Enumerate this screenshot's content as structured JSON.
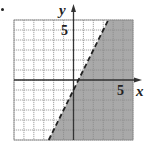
{
  "chart_data": {
    "type": "inequality-graph",
    "title": "",
    "xlabel": "x",
    "ylabel": "y",
    "xlim": [
      -6,
      6
    ],
    "ylim": [
      -6,
      6
    ],
    "grid": true,
    "grid_step": 1,
    "tick_labels": {
      "x": [
        "5"
      ],
      "y": [
        "5"
      ]
    },
    "boundary_line": {
      "equation": "y = 2x - 1",
      "slope": 2,
      "intercept": -1,
      "style": "dashed"
    },
    "inequality": "y < 2x - 1",
    "shaded_region": "below-right of line",
    "colors": {
      "shade": "#a9a9a9",
      "grid": "#8a8a8a",
      "axis": "#333333",
      "line": "#222222"
    }
  },
  "labels": {
    "x_axis": "x",
    "y_axis": "y",
    "x_tick": "5",
    "y_tick": "5"
  }
}
